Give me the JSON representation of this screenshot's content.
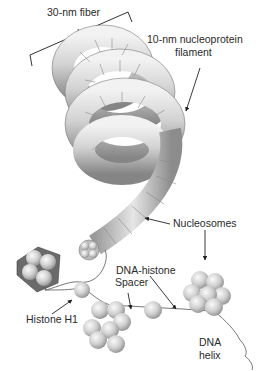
{
  "figure": {
    "type": "chromatin-structure-diagram",
    "labels": {
      "fiber_30nm": "30-nm fiber",
      "filament_line1": "10-nm nucleoprotein",
      "filament_line2": "filament",
      "nucleosomes": "Nucleosomes",
      "dna_histone_line1": "DNA-histone",
      "dna_histone_line2": "Spacer",
      "histone_h1": "Histone H1",
      "dna_line1": "DNA",
      "dna_line2": "helix"
    },
    "colors": {
      "background": "#ffffff",
      "text": "#2a2a2a",
      "tube_light": "#e8e8e8",
      "tube_dark": "#8a8a8a",
      "bead_light": "#f0f0f0",
      "bead_dark": "#9a9a9a",
      "line": "#333333"
    }
  }
}
